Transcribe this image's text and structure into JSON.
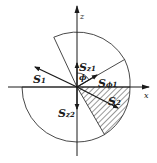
{
  "figure": {
    "colors": {
      "ink": "#1a1a1a",
      "background": "#ffffff"
    },
    "axes": {
      "vertical_label": "z",
      "horizontal_label": "x"
    },
    "angle_label": "ϕ",
    "vectors": [
      {
        "id": "S1",
        "main": "S",
        "sub": "1"
      },
      {
        "id": "Sz1",
        "main": "S",
        "sub": "z1"
      },
      {
        "id": "Sphi1",
        "main": "S",
        "sub": "ϕ1"
      },
      {
        "id": "S2",
        "main": "S",
        "sub": "2"
      },
      {
        "id": "Sz2",
        "main": "S",
        "sub": "z2"
      }
    ],
    "regions": {
      "hatched_sector": "lower-right sector between x-axis and ~-60°"
    }
  }
}
